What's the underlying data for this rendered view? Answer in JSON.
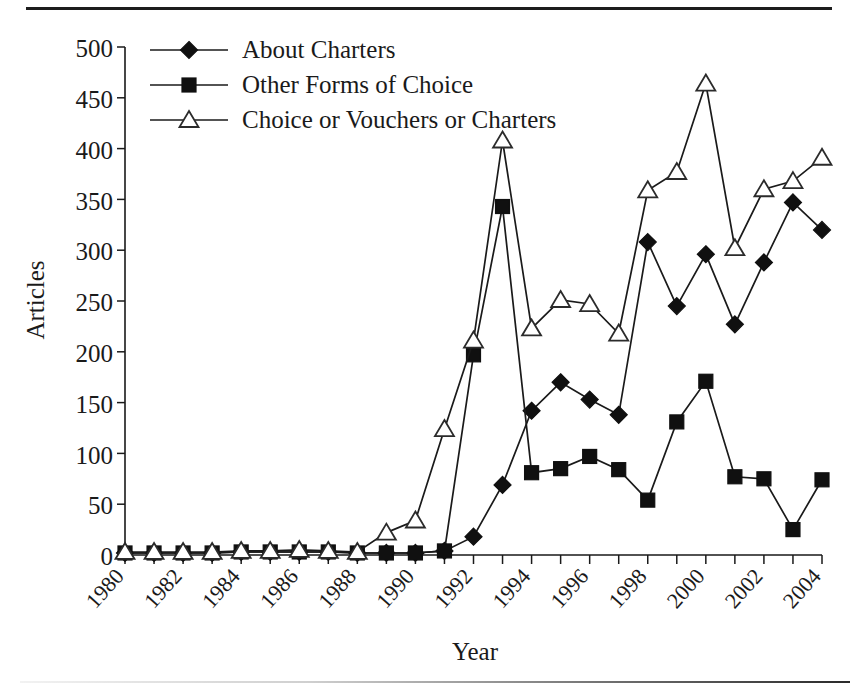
{
  "chart_data": {
    "type": "line",
    "title": "",
    "xlabel": "Year",
    "ylabel": "Articles",
    "xlim": [
      1980,
      2004
    ],
    "ylim": [
      0,
      500
    ],
    "ytick_step": 50,
    "yticks": [
      0,
      50,
      100,
      150,
      200,
      250,
      300,
      350,
      400,
      450,
      500
    ],
    "xticks_major": [
      1980,
      1982,
      1984,
      1986,
      1988,
      1990,
      1992,
      1994,
      1996,
      1998,
      2000,
      2002,
      2004
    ],
    "xtick_labels": [
      "1980",
      "1982",
      "1984",
      "1986",
      "1988",
      "1990",
      "1992",
      "1994",
      "1996",
      "1998",
      "2000",
      "2002",
      "2004"
    ],
    "x": [
      1980,
      1981,
      1982,
      1983,
      1984,
      1985,
      1986,
      1987,
      1988,
      1989,
      1990,
      1991,
      1992,
      1993,
      1994,
      1995,
      1996,
      1997,
      1998,
      1999,
      2000,
      2001,
      2002,
      2003,
      2004
    ],
    "grid": false,
    "legend_position": "top-left",
    "series": [
      {
        "name": "About Charters",
        "marker": "filled-diamond",
        "values": [
          2,
          2,
          2,
          2,
          3,
          3,
          3,
          3,
          2,
          2,
          2,
          4,
          18,
          69,
          142,
          170,
          153,
          138,
          308,
          245,
          296,
          227,
          288,
          347,
          320
        ]
      },
      {
        "name": "Other Forms of Choice",
        "marker": "filled-square",
        "values": [
          2,
          2,
          2,
          2,
          3,
          3,
          3,
          3,
          2,
          2,
          2,
          4,
          197,
          343,
          81,
          85,
          97,
          84,
          54,
          131,
          171,
          77,
          75,
          25,
          74
        ]
      },
      {
        "name": "Choice or Vouchers or Charters",
        "marker": "open-triangle",
        "values": [
          3,
          3,
          3,
          3,
          4,
          4,
          5,
          4,
          3,
          22,
          34,
          124,
          211,
          408,
          223,
          251,
          247,
          218,
          359,
          377,
          464,
          302,
          360,
          368,
          391
        ]
      }
    ]
  },
  "legend": {
    "items": [
      {
        "label": "About Charters",
        "marker": "filled-diamond"
      },
      {
        "label": "Other Forms of Choice",
        "marker": "filled-square"
      },
      {
        "label": "Choice or Vouchers or Charters",
        "marker": "open-triangle"
      }
    ]
  },
  "axes": {
    "y_title": "Articles",
    "x_title": "Year",
    "y_tick_labels": [
      "500",
      "450",
      "400",
      "350",
      "300",
      "250",
      "200",
      "150",
      "100",
      "50",
      "0"
    ]
  }
}
